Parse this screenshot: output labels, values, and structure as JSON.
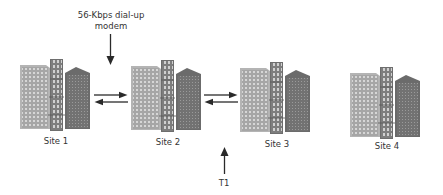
{
  "diagram": {
    "type": "network-topology",
    "sites": [
      {
        "id": "site1",
        "label": "Site 1"
      },
      {
        "id": "site2",
        "label": "Site 2"
      },
      {
        "id": "site3",
        "label": "Site 3"
      },
      {
        "id": "site4",
        "label": "Site 4"
      }
    ],
    "links": [
      {
        "from": "site1",
        "to": "site2",
        "direction": "bidirectional",
        "type": "56-Kbps dial-up modem"
      },
      {
        "from": "site2",
        "to": "site3",
        "direction": "bidirectional",
        "type": "T1"
      }
    ],
    "annotations": {
      "modem_line1": "56-Kbps dial-up",
      "modem_line2": "modem",
      "t1": "T1"
    },
    "icons": {
      "site": "office-buildings-icon",
      "link": "bidirectional-arrow-icon",
      "pointer": "pointer-arrow-icon"
    },
    "colors": {
      "building_light": "#a9a9a9",
      "building_mid": "#8a8a8a",
      "building_dark": "#6f6f6f",
      "window": "#d9d9d9",
      "arrow": "#2a2a2a"
    }
  }
}
